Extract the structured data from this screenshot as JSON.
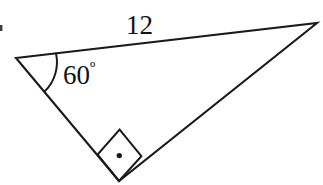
{
  "figure": {
    "type": "right-triangle-diagram",
    "background_color": "#ffffff",
    "stroke_color": "#1a1a1a",
    "labels": {
      "side_top": "12",
      "angle_left_value": "60",
      "angle_left_degree_symbol": "º",
      "angle_left_full": "60º"
    },
    "vertices": {
      "left": {
        "x": 16,
        "y": 58
      },
      "top_right": {
        "x": 317,
        "y": 23
      },
      "bottom": {
        "x": 119,
        "y": 181
      }
    },
    "edges": [
      {
        "name": "top-edge",
        "from": "left",
        "to": "top_right",
        "label": "12"
      },
      {
        "name": "left-edge",
        "from": "left",
        "to": "bottom",
        "label": ""
      },
      {
        "name": "hypotenuse-edge",
        "from": "bottom",
        "to": "top_right",
        "label": ""
      }
    ],
    "markers": {
      "angle_arc": {
        "name": "angle-arc-60",
        "vertex": "left",
        "value": "60º"
      },
      "right_angle": {
        "name": "right-angle-square",
        "vertex": "bottom",
        "has_center_dot": true
      }
    },
    "artifact": {
      "name": "edge-scan-artifact",
      "x": 0,
      "y": 25,
      "width": 3,
      "height": 6
    }
  }
}
